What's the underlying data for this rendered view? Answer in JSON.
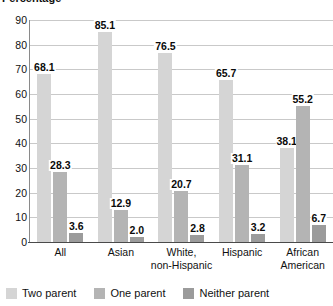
{
  "chart_data": {
    "type": "bar",
    "title": "Percentage",
    "xlabel": "",
    "ylabel": "Percentage",
    "ylim": [
      0,
      90
    ],
    "ytick_step": 10,
    "yticks": [
      90,
      80,
      70,
      60,
      50,
      40,
      30,
      20,
      10,
      0
    ],
    "grid": true,
    "legend_position": "bottom-left",
    "categories": [
      "All",
      "Asian",
      "White,\nnon-Hispanic",
      "Hispanic",
      "African\nAmerican"
    ],
    "category_lines": [
      [
        "All"
      ],
      [
        "Asian"
      ],
      [
        "White,",
        "non-Hispanic"
      ],
      [
        "Hispanic"
      ],
      [
        "African",
        "American"
      ]
    ],
    "series": [
      {
        "name": "Two parent",
        "color": "#d5d5d5",
        "values": [
          68.1,
          85.1,
          76.5,
          65.7,
          38.1
        ],
        "labels": [
          "68.1",
          "85.1",
          "76.5",
          "65.7",
          "38.1"
        ]
      },
      {
        "name": "One parent",
        "color": "#b4b4b4",
        "values": [
          28.3,
          12.9,
          20.7,
          31.1,
          55.2
        ],
        "labels": [
          "28.3",
          "12.9",
          "20.7",
          "31.1",
          "55.2"
        ]
      },
      {
        "name": "Neither parent",
        "color": "#9b9b9b",
        "values": [
          3.6,
          2.0,
          2.8,
          3.2,
          6.7
        ],
        "labels": [
          "3.6",
          "2.0",
          "2.8",
          "3.2",
          "6.7"
        ]
      }
    ]
  },
  "axis_title": "Percentage",
  "legend": {
    "items": [
      {
        "label": "Two parent",
        "color": "#d5d5d5"
      },
      {
        "label": "One parent",
        "color": "#b4b4b4"
      },
      {
        "label": "Neither parent",
        "color": "#9b9b9b"
      }
    ]
  }
}
